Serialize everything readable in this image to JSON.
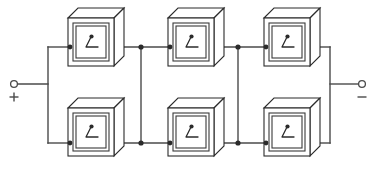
{
  "diagram": {
    "type": "circuit-schematic",
    "background_color": "#ffffff",
    "line_color": "#4a4a4a",
    "cell_outline_color": "#2b2b2b",
    "canvas": {
      "width": 381,
      "height": 170
    },
    "terminals": [
      {
        "id": "positive-terminal",
        "label": "+",
        "side": "left",
        "x": 14,
        "y": 84,
        "radius": 3.4,
        "lead_end_x": 48
      },
      {
        "id": "negative-terminal",
        "label": "−",
        "side": "right",
        "x": 362,
        "y": 84,
        "radius": 3.4,
        "lead_end_x": 330
      }
    ],
    "cells": [
      {
        "id": "cell-top-left",
        "row": "top",
        "column": 1,
        "x": 68,
        "y": 8,
        "width": 46,
        "height": 58
      },
      {
        "id": "cell-top-middle",
        "row": "top",
        "column": 2,
        "x": 168,
        "y": 8,
        "width": 46,
        "height": 58
      },
      {
        "id": "cell-top-right",
        "row": "top",
        "column": 3,
        "x": 264,
        "y": 8,
        "width": 46,
        "height": 58
      },
      {
        "id": "cell-bottom-left",
        "row": "bottom",
        "column": 1,
        "x": 68,
        "y": 98,
        "width": 46,
        "height": 58
      },
      {
        "id": "cell-bottom-middle",
        "row": "bottom",
        "column": 2,
        "x": 168,
        "y": 98,
        "width": 46,
        "height": 58
      },
      {
        "id": "cell-bottom-right",
        "row": "bottom",
        "column": 3,
        "x": 264,
        "y": 98,
        "width": 46,
        "height": 58
      }
    ],
    "rows": {
      "top_bus_y": 47,
      "bottom_bus_y": 143
    },
    "junctions": [
      {
        "id": "junction-top-1",
        "x": 141,
        "y": 47
      },
      {
        "id": "junction-top-2",
        "x": 238,
        "y": 47
      },
      {
        "id": "junction-bottom-1",
        "x": 141,
        "y": 143
      },
      {
        "id": "junction-bottom-2",
        "x": 238,
        "y": 143
      }
    ],
    "crosslinks": [
      {
        "id": "crosslink-left",
        "x": 141,
        "y1": 47,
        "y2": 143
      },
      {
        "id": "crosslink-right",
        "x": 238,
        "y1": 47,
        "y2": 143
      }
    ],
    "buses": {
      "left_bracket_x": 48,
      "right_bracket_x": 330
    }
  }
}
